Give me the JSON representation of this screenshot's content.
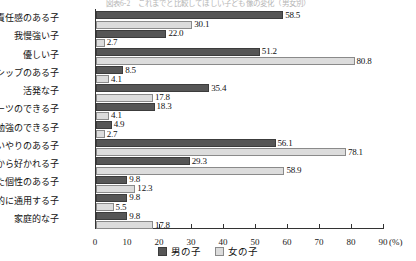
{
  "caption": "図表6-2　これまでと比較してほしい子ども像の変化（男女別）",
  "chart_data": {
    "type": "bar",
    "orientation": "horizontal",
    "title": "",
    "xlabel": "(%)",
    "ylabel": "",
    "xlim": [
      0,
      90
    ],
    "xticks": [
      0,
      10,
      20,
      30,
      40,
      50,
      60,
      70,
      80,
      90
    ],
    "xtick_labels": [
      "0",
      "10",
      "20",
      "30",
      "40",
      "50",
      "60",
      "70",
      "80",
      "90"
    ],
    "unit_label": "(%)",
    "grid": false,
    "legend_position": "bottom-center",
    "categories": [
      "責任感のある子",
      "我慢強い子",
      "優しい子",
      "リーダーシップのある子",
      "活発な子",
      "スポーツのできる子",
      "お勉強のできる子",
      "思いやりのある子",
      "人から好かれる子",
      "一芸秀でた個性のある子",
      "国際的に通用する子",
      "家庭的な子"
    ],
    "series": [
      {
        "name": "男の子",
        "color": "#565656",
        "values": [
          58.5,
          22.0,
          51.2,
          8.5,
          35.4,
          18.3,
          4.9,
          56.1,
          29.3,
          9.8,
          9.8,
          9.8
        ],
        "labels": [
          "58.5",
          "22.0",
          "51.2",
          "8.5",
          "35.4",
          "18.3",
          "4.9",
          "56.1",
          "29.3",
          "9.8",
          "9.8",
          "9.8"
        ]
      },
      {
        "name": "女の子",
        "color": "#dcdcdc",
        "values": [
          30.1,
          2.7,
          80.8,
          4.1,
          17.8,
          4.1,
          2.7,
          78.1,
          58.9,
          12.3,
          5.5,
          17.8
        ],
        "labels": [
          "30.1",
          "2.7",
          "80.8",
          "4.1",
          "17.8",
          "4.1",
          "2.7",
          "78.1",
          "58.9",
          "12.3",
          "5.5",
          "17.8"
        ]
      }
    ]
  },
  "legend": {
    "items": [
      {
        "label": "男の子",
        "swatch": "boy"
      },
      {
        "label": "女の子",
        "swatch": "girl"
      }
    ]
  }
}
